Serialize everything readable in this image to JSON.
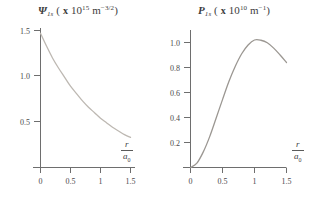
{
  "figure": {
    "background_color": "#ffffff",
    "axis_color": "#6e6e6e",
    "text_color": "#3d3d3d"
  },
  "panels": [
    {
      "id": "psi-panel",
      "title": {
        "symbol": "Ψ",
        "subscript": "1s",
        "units_prefix": "( x 10",
        "units_exp": "15",
        "units_base": " m",
        "units_base_exp": "−3/2",
        "units_suffix": ")",
        "full_text": "Ψ₁ₛ ( x 10¹⁵ m⁻³ᐟ²)"
      },
      "yticks": [
        "0.5",
        "1.0",
        "1.5"
      ],
      "xticks": [
        "0",
        "0.5",
        "1",
        "1.5"
      ],
      "xlabel_num": "r",
      "xlabel_den": "a",
      "xlabel_den_sub": "0",
      "curve_color": "#bdb8b2"
    },
    {
      "id": "prob-panel",
      "title": {
        "symbol": "P",
        "subscript": "1s",
        "units_prefix": "( x 10",
        "units_exp": "10",
        "units_base": " m",
        "units_base_exp": "−1",
        "units_suffix": ")",
        "full_text": "P₁ₛ ( x 10¹⁰ m⁻¹)"
      },
      "yticks": [
        "0.2",
        "0.4",
        "0.6",
        "0.8",
        "1.0"
      ],
      "xticks": [
        "0",
        "0.5",
        "1",
        "1.5"
      ],
      "xlabel_num": "r",
      "xlabel_den": "a",
      "xlabel_den_sub": "0",
      "curve_color": "#9b9792"
    }
  ],
  "chart_data": [
    {
      "type": "line",
      "id": "psi-1s-radial-wavefunction",
      "title": "Ψ₁ₛ ( x 10¹⁵ m⁻³ᐟ²)",
      "xlabel": "r / a₀",
      "ylabel": "Ψ₁ₛ ( x 10¹⁵ m⁻³ᐟ²)",
      "xlim": [
        0,
        1.6
      ],
      "ylim": [
        0,
        1.6
      ],
      "xticks": [
        0,
        0.5,
        1,
        1.5
      ],
      "yticks": [
        0.5,
        1.0,
        1.5
      ],
      "grid": false,
      "legend": "none",
      "series": [
        {
          "name": "Ψ_1s",
          "x": [
            0.0,
            0.1,
            0.2,
            0.3,
            0.4,
            0.5,
            0.6,
            0.7,
            0.8,
            0.9,
            1.0,
            1.1,
            1.2,
            1.3,
            1.4,
            1.5
          ],
          "values": [
            1.47,
            1.33,
            1.2,
            1.09,
            0.99,
            0.89,
            0.81,
            0.73,
            0.66,
            0.6,
            0.54,
            0.49,
            0.44,
            0.4,
            0.36,
            0.33
          ]
        }
      ]
    },
    {
      "type": "line",
      "id": "p-1s-radial-probability-density",
      "title": "P₁ₛ ( x 10¹⁰ m⁻¹)",
      "xlabel": "r / a₀",
      "ylabel": "P₁ₛ ( x 10¹⁰ m⁻¹)",
      "xlim": [
        0,
        1.6
      ],
      "ylim": [
        0,
        1.12
      ],
      "xticks": [
        0,
        0.5,
        1,
        1.5
      ],
      "yticks": [
        0.2,
        0.4,
        0.6,
        0.8,
        1.0
      ],
      "grid": false,
      "legend": "none",
      "peak": {
        "x": 1.0,
        "y": 1.02
      },
      "series": [
        {
          "name": "P_1s",
          "x": [
            0.0,
            0.1,
            0.2,
            0.3,
            0.4,
            0.5,
            0.6,
            0.7,
            0.8,
            0.9,
            1.0,
            1.1,
            1.2,
            1.3,
            1.4,
            1.5
          ],
          "values": [
            0.0,
            0.035,
            0.125,
            0.247,
            0.394,
            0.543,
            0.688,
            0.81,
            0.91,
            0.98,
            1.02,
            1.018,
            0.998,
            0.955,
            0.9,
            0.84
          ]
        }
      ]
    }
  ]
}
